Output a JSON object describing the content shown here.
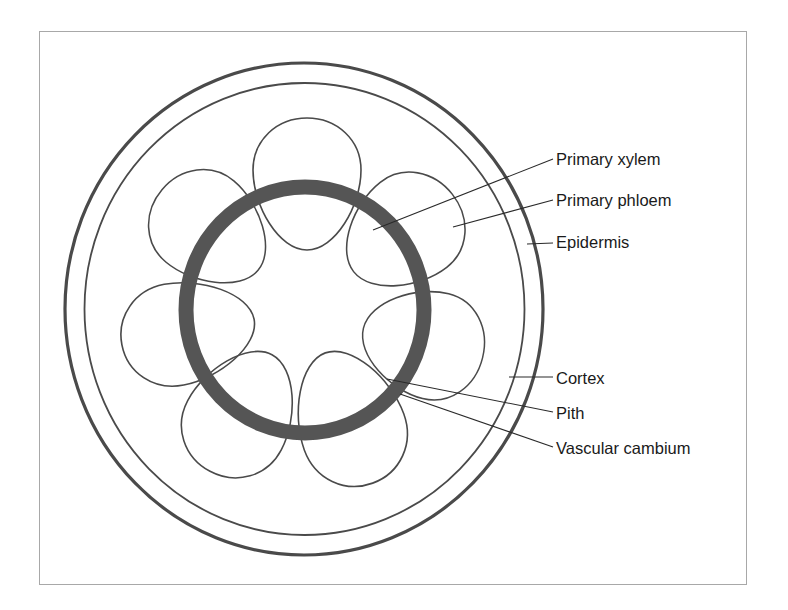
{
  "figure": {
    "colors": {
      "line": "#4a4a4a",
      "cambium": "#555555",
      "frame": "#a8a8a8",
      "text": "#1a1a1a",
      "background": "#ffffff"
    }
  },
  "labels": [
    {
      "id": "primary-xylem",
      "text": "Primary xylem",
      "y": 159
    },
    {
      "id": "primary-phloem",
      "text": "Primary phloem",
      "y": 200
    },
    {
      "id": "epidermis",
      "text": "Epidermis",
      "y": 242
    },
    {
      "id": "cortex",
      "text": "Cortex",
      "y": 378
    },
    {
      "id": "pith",
      "text": "Pith",
      "y": 413
    },
    {
      "id": "vascular-cambium",
      "text": "Vascular cambium",
      "y": 448
    }
  ],
  "structures": {
    "epidermis": {
      "cx": 304,
      "cy": 309,
      "rx": 239,
      "ry": 246
    },
    "cortex_inner_boundary": {
      "cx": 304.5,
      "cy": 309,
      "rx": 220,
      "ry": 226
    },
    "vascular_cambium_ring": {
      "cx": 305,
      "cy": 310,
      "rx": 119,
      "ry": 123,
      "thickness": 15
    },
    "vascular_bundle_count": 7
  }
}
